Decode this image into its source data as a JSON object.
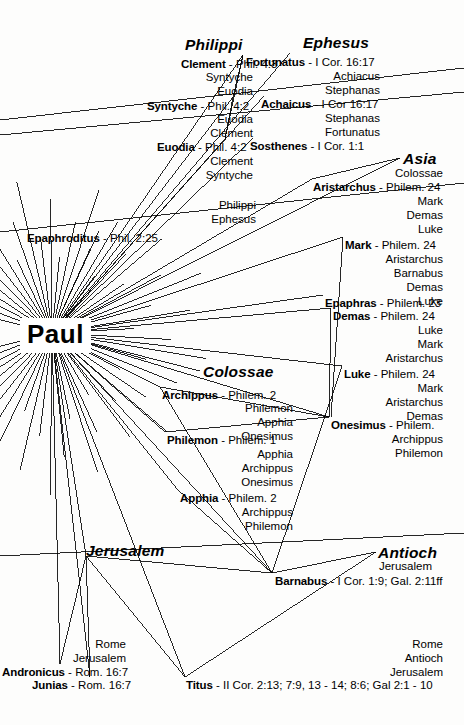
{
  "diagram": {
    "title": "Paul",
    "hub": {
      "label": "Paul",
      "x": 20,
      "y": 318
    },
    "ink_color": "#000000",
    "background_color": "#fdfdfc"
  },
  "places": [
    {
      "name": "philippi",
      "label": "Philippi",
      "x": 185,
      "y": 36
    },
    {
      "name": "ephesus",
      "label": "Ephesus",
      "x": 303,
      "y": 34
    },
    {
      "name": "asia",
      "label": "Asia",
      "x": 403,
      "y": 150
    },
    {
      "name": "colossae",
      "label": "Colossae",
      "x": 203,
      "y": 363
    },
    {
      "name": "jerusalem",
      "label": "Jerusalem",
      "x": 86,
      "y": 542
    },
    {
      "name": "antioch",
      "label": "Antioch",
      "x": 378,
      "y": 544
    }
  ],
  "people": [
    {
      "name": "clement",
      "person": "Clement",
      "sep": " - ",
      "ref": "Phil. 4:3",
      "x": 181,
      "y": 58,
      "align": "left"
    },
    {
      "name": "syntyche",
      "person": "Syntyche",
      "sep": " - ",
      "ref": "Phil. 4:2",
      "x": 147,
      "y": 100,
      "align": "left"
    },
    {
      "name": "euodia",
      "person": "Euodia",
      "sep": " - ",
      "ref": "Phil. 4:2",
      "x": 157,
      "y": 141,
      "align": "left"
    },
    {
      "name": "epaphroditus",
      "person": "Epaphroditus",
      "sep": " - ",
      "ref": "Phil. 2:25",
      "x": 158,
      "y": 232,
      "align": "right"
    },
    {
      "name": "fortunatus",
      "person": "Fortunatus",
      "sep": " - ",
      "ref": "I Cor. 16:17",
      "x": 246,
      "y": 56,
      "align": "left"
    },
    {
      "name": "achaicus",
      "person": "Achaicus",
      "sep": " - ",
      "ref": "I Cor 16:17",
      "x": 261,
      "y": 98,
      "align": "left"
    },
    {
      "name": "sosthenes",
      "person": "Sosthenes",
      "sep": " - ",
      "ref": "I Cor. 1:1",
      "x": 250,
      "y": 140,
      "align": "left"
    },
    {
      "name": "aristarchus",
      "person": "Aristarchus",
      "sep": " - ",
      "ref": "Philem. 24",
      "x": 313,
      "y": 181,
      "align": "left"
    },
    {
      "name": "mark",
      "person": "Mark",
      "sep": " - ",
      "ref": "Philem. 24",
      "x": 345,
      "y": 239,
      "align": "left"
    },
    {
      "name": "epaphras",
      "person": "Epaphras",
      "sep": " - ",
      "ref": "Philem. 23",
      "x": 325,
      "y": 297,
      "align": "left"
    },
    {
      "name": "demas",
      "person": "Demas",
      "sep": " - ",
      "ref": "Philem. 24",
      "x": 333,
      "y": 310,
      "align": "left"
    },
    {
      "name": "luke",
      "person": "Luke",
      "sep": " - ",
      "ref": "Philem. 24",
      "x": 344,
      "y": 368,
      "align": "left"
    },
    {
      "name": "onesimus",
      "person": "Onesimus",
      "sep": " - ",
      "ref": "Philem.",
      "x": 331,
      "y": 419,
      "align": "left"
    },
    {
      "name": "archippus",
      "person": "Archippus",
      "sep": " - ",
      "ref": "Philem. 2",
      "x": 162,
      "y": 389,
      "align": "left"
    },
    {
      "name": "philemon",
      "person": "Philemon",
      "sep": " - ",
      "ref": "Philem. 1",
      "x": 167,
      "y": 434,
      "align": "left"
    },
    {
      "name": "apphia",
      "person": "Apphia",
      "sep": " - ",
      "ref": "Philem. 2",
      "x": 180,
      "y": 492,
      "align": "left"
    },
    {
      "name": "barnabas",
      "person": "Barnabus",
      "sep": " - ",
      "ref": "I Cor. 1:9; Gal. 2:11ff",
      "x": 275,
      "y": 575,
      "align": "left"
    },
    {
      "name": "andronicus",
      "person": "Andronicus",
      "sep": " - ",
      "ref": "Rom. 16:7",
      "x": 2,
      "y": 666,
      "align": "left"
    },
    {
      "name": "junias",
      "person": "Junias",
      "sep": " - ",
      "ref": "Rom. 16:7",
      "x": 32,
      "y": 679,
      "align": "left"
    },
    {
      "name": "titus",
      "person": "Titus",
      "sep": " - ",
      "ref": "II Cor. 2:13; 7:9, 13 - 14; 8:6; Gal 2:1 - 10",
      "x": 186,
      "y": 679,
      "align": "left"
    }
  ],
  "associates": [
    {
      "name": "assoc-philippi-1",
      "label": "Syntyche",
      "x": 253,
      "y": 71
    },
    {
      "name": "assoc-philippi-2",
      "label": "Euodia",
      "x": 253,
      "y": 85
    },
    {
      "name": "assoc-philippi-3",
      "label": "Euodia",
      "x": 253,
      "y": 113
    },
    {
      "name": "assoc-philippi-4",
      "label": "Clement",
      "x": 253,
      "y": 127
    },
    {
      "name": "assoc-philippi-5",
      "label": "Clement",
      "x": 253,
      "y": 155
    },
    {
      "name": "assoc-philippi-6",
      "label": "Syntyche",
      "x": 253,
      "y": 169
    },
    {
      "name": "assoc-epaph-1",
      "label": "Philippi",
      "x": 256,
      "y": 199
    },
    {
      "name": "assoc-epaph-2",
      "label": "Ephesus",
      "x": 256,
      "y": 213
    },
    {
      "name": "assoc-ephesus-1",
      "label": "Achiacus",
      "x": 380,
      "y": 70
    },
    {
      "name": "assoc-ephesus-2",
      "label": "Stephanas",
      "x": 380,
      "y": 84
    },
    {
      "name": "assoc-ephesus-3",
      "label": "Stephanas",
      "x": 380,
      "y": 112
    },
    {
      "name": "assoc-ephesus-4",
      "label": "Fortunatus",
      "x": 380,
      "y": 126
    },
    {
      "name": "assoc-asia-1",
      "label": "Colossae",
      "x": 443,
      "y": 167
    },
    {
      "name": "assoc-aris-1",
      "label": "Mark",
      "x": 443,
      "y": 195
    },
    {
      "name": "assoc-aris-2",
      "label": "Demas",
      "x": 443,
      "y": 209
    },
    {
      "name": "assoc-aris-3",
      "label": "Luke",
      "x": 443,
      "y": 223
    },
    {
      "name": "assoc-mark-1",
      "label": "Aristarchus",
      "x": 443,
      "y": 253
    },
    {
      "name": "assoc-mark-2",
      "label": "Barnabus",
      "x": 443,
      "y": 267
    },
    {
      "name": "assoc-mark-3",
      "label": "Demas",
      "x": 443,
      "y": 281
    },
    {
      "name": "assoc-mark-4",
      "label": "Luke",
      "x": 443,
      "y": 295
    },
    {
      "name": "assoc-demas-1",
      "label": "Luke",
      "x": 443,
      "y": 324
    },
    {
      "name": "assoc-demas-2",
      "label": "Mark",
      "x": 443,
      "y": 338
    },
    {
      "name": "assoc-demas-3",
      "label": "Aristarchus",
      "x": 443,
      "y": 352
    },
    {
      "name": "assoc-luke-1",
      "label": "Mark",
      "x": 443,
      "y": 382
    },
    {
      "name": "assoc-luke-2",
      "label": "Aristarchus",
      "x": 443,
      "y": 396
    },
    {
      "name": "assoc-luke-3",
      "label": "Demas",
      "x": 443,
      "y": 410
    },
    {
      "name": "assoc-ones-1",
      "label": "Archippus",
      "x": 443,
      "y": 433
    },
    {
      "name": "assoc-ones-2",
      "label": "Philemon",
      "x": 443,
      "y": 447
    },
    {
      "name": "assoc-col-1",
      "label": "Philemon",
      "x": 293,
      "y": 402
    },
    {
      "name": "assoc-col-2",
      "label": "Apphia",
      "x": 293,
      "y": 416
    },
    {
      "name": "assoc-col-3",
      "label": "Onesimus",
      "x": 293,
      "y": 430
    },
    {
      "name": "assoc-col-4",
      "label": "Apphia",
      "x": 293,
      "y": 448
    },
    {
      "name": "assoc-col-5",
      "label": "Archippus",
      "x": 293,
      "y": 462
    },
    {
      "name": "assoc-col-6",
      "label": "Onesimus",
      "x": 293,
      "y": 476
    },
    {
      "name": "assoc-col-7",
      "label": "Archippus",
      "x": 293,
      "y": 506
    },
    {
      "name": "assoc-col-8",
      "label": "Philemon",
      "x": 293,
      "y": 520
    },
    {
      "name": "assoc-antioch-1",
      "label": "Jerusalem",
      "x": 432,
      "y": 560
    },
    {
      "name": "assoc-andro-1",
      "label": "Rome",
      "x": 126,
      "y": 638
    },
    {
      "name": "assoc-andro-2",
      "label": "Jerusalem",
      "x": 126,
      "y": 652
    },
    {
      "name": "assoc-titus-1",
      "label": "Rome",
      "x": 443,
      "y": 638
    },
    {
      "name": "assoc-titus-2",
      "label": "Antioch",
      "x": 443,
      "y": 652
    },
    {
      "name": "assoc-titus-3",
      "label": "Jerusalem",
      "x": 443,
      "y": 666
    }
  ],
  "edges": {
    "description": "Lines radiating from the Paul hub to each named associate, plus secondary links between associates and between place clusters.",
    "hub_point": {
      "x": 52,
      "y": 333
    },
    "jerusalem_point": {
      "x": 86,
      "y": 556
    },
    "targets": [
      {
        "to": "clement",
        "x": 243,
        "y": 55
      },
      {
        "to": "syntyche",
        "x": 233,
        "y": 97
      },
      {
        "to": "euodia",
        "x": 225,
        "y": 139
      },
      {
        "to": "epaphroditus",
        "x": 99,
        "y": 231
      },
      {
        "to": "fortunatus",
        "x": 290,
        "y": 53
      },
      {
        "to": "achaicus",
        "x": 264,
        "y": 96
      },
      {
        "to": "sosthenes",
        "x": 253,
        "y": 138
      },
      {
        "to": "asia",
        "x": 400,
        "y": 158
      },
      {
        "to": "aristarchus",
        "x": 312,
        "y": 179
      },
      {
        "to": "mark",
        "x": 343,
        "y": 237
      },
      {
        "to": "epaphras",
        "x": 323,
        "y": 295
      },
      {
        "to": "demas",
        "x": 331,
        "y": 308
      },
      {
        "to": "luke",
        "x": 342,
        "y": 366
      },
      {
        "to": "onesimus",
        "x": 329,
        "y": 417
      },
      {
        "to": "colossae",
        "x": 200,
        "y": 371
      },
      {
        "to": "archippus",
        "x": 160,
        "y": 387
      },
      {
        "to": "philemon",
        "x": 165,
        "y": 432
      },
      {
        "to": "apphia",
        "x": 178,
        "y": 490
      },
      {
        "to": "barnabas",
        "x": 272,
        "y": 573
      },
      {
        "to": "jerusalem",
        "x": 86,
        "y": 556
      },
      {
        "to": "andronicus",
        "x": 60,
        "y": 664
      },
      {
        "to": "junias",
        "x": 90,
        "y": 677
      },
      {
        "to": "titus",
        "x": 185,
        "y": 677
      }
    ]
  }
}
